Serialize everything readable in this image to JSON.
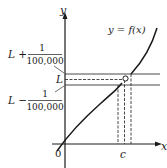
{
  "diagram": {
    "axes": {
      "y_label": "y",
      "x_label": "x",
      "origin_label": "0"
    },
    "curve_label": "y = f(x)",
    "limit_labels": {
      "upper": {
        "prefix": "L +",
        "numerator": "1",
        "denominator": "100,000"
      },
      "middle": "L",
      "lower": {
        "prefix": "L −",
        "numerator": "1",
        "denominator": "100,000"
      }
    },
    "point_label": "c",
    "colors": {
      "line": "#1a1a1a",
      "dashed": "#333333",
      "background": "#ffffff"
    }
  }
}
